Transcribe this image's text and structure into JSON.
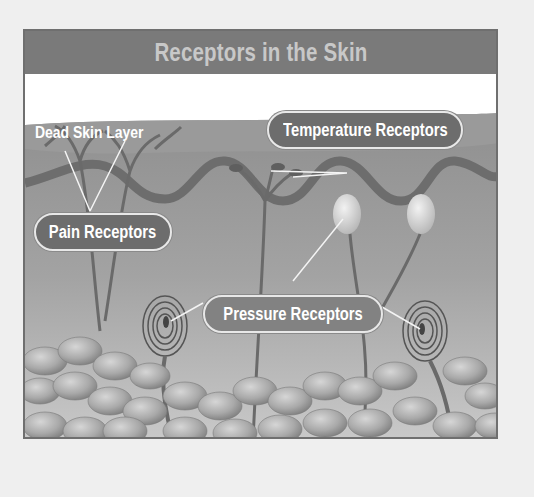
{
  "diagram": {
    "title": "Receptors in the Skin",
    "labels": {
      "dead_skin_layer": "Dead Skin Layer",
      "temperature_receptors": "Temperature Receptors",
      "pain_receptors": "Pain Receptors",
      "pressure_receptors": "Pressure Receptors"
    },
    "colors": {
      "background": "#efefef",
      "title_bar": "#7a7a7a",
      "title_text": "#c8c8c8",
      "label_pill": "#6d6d6d",
      "label_text": "#ffffff",
      "skin": "#a6a6a6",
      "border": "#6f6f6f"
    }
  }
}
